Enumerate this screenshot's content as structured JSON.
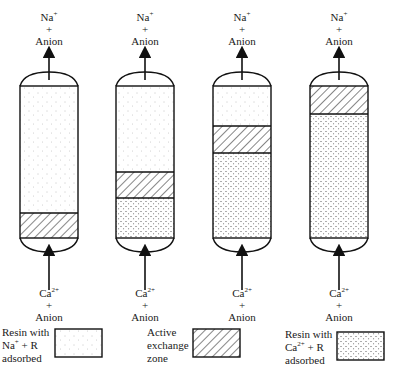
{
  "figure": {
    "columns": [
      {
        "id": 1,
        "top_label": {
          "ion": "Na",
          "charge": "+",
          "plus": "+",
          "anion": "Anion"
        },
        "bottom_label": {
          "ion": "Ca",
          "charge": "2+",
          "plus": "+",
          "anion": "Anion"
        },
        "zones": {
          "na_top": 86,
          "active_top": 213,
          "ca_top": 238,
          "bottom": 238
        }
      },
      {
        "id": 2,
        "top_label": {
          "ion": "Na",
          "charge": "+",
          "plus": "+",
          "anion": "Anion"
        },
        "bottom_label": {
          "ion": "Ca",
          "charge": "2+",
          "plus": "+",
          "anion": "Anion"
        },
        "zones": {
          "na_top": 86,
          "active_top": 172,
          "ca_top": 198,
          "bottom": 238
        }
      },
      {
        "id": 3,
        "top_label": {
          "ion": "Na",
          "charge": "+",
          "plus": "+",
          "anion": "Anion"
        },
        "bottom_label": {
          "ion": "Ca",
          "charge": "2+",
          "plus": "+",
          "anion": "Anion"
        },
        "zones": {
          "na_top": 86,
          "active_top": 126,
          "ca_top": 153,
          "bottom": 238
        }
      },
      {
        "id": 4,
        "top_label": {
          "ion": "Na",
          "charge": "+",
          "plus": "+",
          "anion": "Anion"
        },
        "bottom_label": {
          "ion": "Ca",
          "charge": "2+",
          "plus": "+",
          "anion": "Anion"
        },
        "zones": {
          "na_top": 86,
          "active_top": 86,
          "ca_top": 114,
          "bottom": 238
        }
      }
    ],
    "legend": [
      {
        "key": "na-resin",
        "line1": "Resin with",
        "line2_ion": "Na",
        "line2_charge": "+",
        "line2_rest": " + R",
        "line3": "adsorbed"
      },
      {
        "key": "active-zone",
        "line1": "Active",
        "line2": "exchange",
        "line3": "zone"
      },
      {
        "key": "ca-resin",
        "line1": "Resin with",
        "line2_ion": "Ca",
        "line2_charge": "2+",
        "line2_rest": " + R",
        "line3": "adsorbed"
      }
    ],
    "caption": "Figure 4.20 ..."
  }
}
